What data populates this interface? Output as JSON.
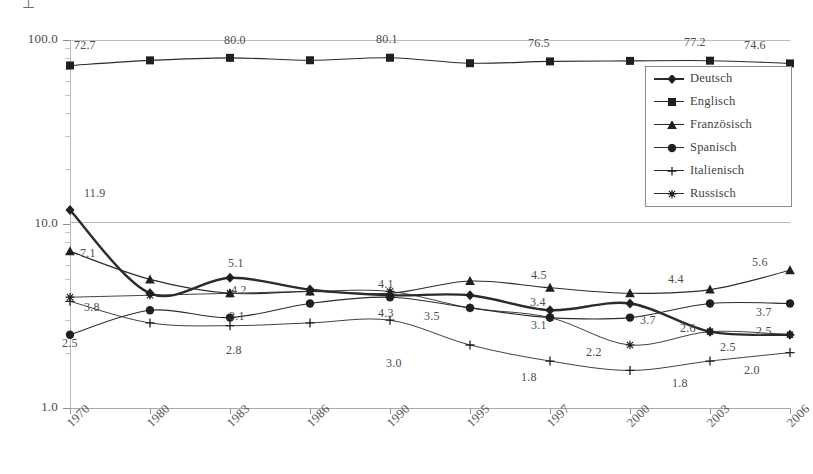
{
  "chart_data": {
    "type": "line",
    "title": "",
    "subtitle": "",
    "xlabel": "",
    "ylabel": "",
    "scale": "log",
    "grid": true,
    "legend_position": "inside-top-right",
    "categories": [
      "1970",
      "1980",
      "1983",
      "1986",
      "1990",
      "1995",
      "1997",
      "2000",
      "2003",
      "2006"
    ],
    "yticks": [
      "1.0",
      "10.0",
      "100.0"
    ],
    "ylim": [
      1.0,
      100.0
    ],
    "series": [
      {
        "name": "Deutsch",
        "marker": "diamond",
        "emphasis": "thick",
        "values": [
          11.9,
          4.2,
          5.1,
          4.4,
          4.1,
          4.1,
          3.4,
          3.7,
          2.6,
          2.5
        ],
        "labels": [
          "11.9",
          "",
          "5.1",
          "",
          "4.1",
          "",
          "3.4",
          "3.7",
          "2.6",
          "2.5"
        ]
      },
      {
        "name": "Englisch",
        "marker": "square",
        "emphasis": "normal",
        "values": [
          72.7,
          77.5,
          80.0,
          77.6,
          80.1,
          74.8,
          76.5,
          77.0,
          77.2,
          74.6
        ],
        "labels": [
          "72.7",
          "",
          "80.0",
          "",
          "80.1",
          "",
          "76.5",
          "",
          "77.2",
          "74.6"
        ]
      },
      {
        "name": "Französisch",
        "marker": "triangle",
        "emphasis": "normal",
        "values": [
          7.1,
          5.0,
          4.2,
          4.3,
          4.2,
          4.9,
          4.5,
          4.2,
          4.4,
          5.6
        ],
        "labels": [
          "7.1",
          "",
          "4.2",
          "",
          "",
          "",
          "4.5",
          "",
          "4.4",
          "5.6"
        ]
      },
      {
        "name": "Spanisch",
        "marker": "circle",
        "emphasis": "normal",
        "values": [
          2.5,
          3.4,
          3.1,
          3.7,
          4.0,
          3.5,
          3.1,
          3.1,
          3.7,
          3.7
        ],
        "labels": [
          "2.5",
          "",
          "3.1",
          "",
          "",
          "3.5",
          "3.1",
          "",
          "",
          "3.7"
        ]
      },
      {
        "name": "Italienisch",
        "marker": "plus",
        "emphasis": "thin",
        "values": [
          3.8,
          2.9,
          2.8,
          2.9,
          3.0,
          2.2,
          1.8,
          1.6,
          1.8,
          2.0
        ],
        "labels": [
          "3.8",
          "",
          "",
          "",
          "3.0",
          "",
          "1.8",
          "",
          "1.8",
          "2.0"
        ]
      },
      {
        "name": "Russisch",
        "marker": "asterisk",
        "emphasis": "thin",
        "values": [
          4.0,
          4.1,
          4.2,
          4.3,
          4.3,
          3.5,
          3.1,
          2.2,
          2.6,
          2.5
        ],
        "labels": [
          "",
          "",
          "",
          "",
          "4.3",
          "",
          "3.1",
          "2.2",
          "",
          "2.5"
        ]
      }
    ],
    "data_labels": [
      {
        "text": "72.7",
        "x": 74,
        "y": 38
      },
      {
        "text": "80.0",
        "x": 224,
        "y": 33
      },
      {
        "text": "80.1",
        "x": 376,
        "y": 32
      },
      {
        "text": "76.5",
        "x": 528,
        "y": 36
      },
      {
        "text": "77.2",
        "x": 684,
        "y": 35
      },
      {
        "text": "74.6",
        "x": 744,
        "y": 38
      },
      {
        "text": "11.9",
        "x": 84,
        "y": 186
      },
      {
        "text": "7.1",
        "x": 80,
        "y": 246
      },
      {
        "text": "3.8",
        "x": 84,
        "y": 300
      },
      {
        "text": "2.5",
        "x": 62,
        "y": 336
      },
      {
        "text": "5.1",
        "x": 228,
        "y": 256
      },
      {
        "text": "4.2",
        "x": 231,
        "y": 283
      },
      {
        "text": "3.1",
        "x": 229,
        "y": 309
      },
      {
        "text": "2.8",
        "x": 226,
        "y": 343
      },
      {
        "text": "4.3",
        "x": 378,
        "y": 306
      },
      {
        "text": "4.1",
        "x": 378,
        "y": 277
      },
      {
        "text": "3.0",
        "x": 386,
        "y": 356
      },
      {
        "text": "3.5",
        "x": 424,
        "y": 309
      },
      {
        "text": "4.5",
        "x": 531,
        "y": 268
      },
      {
        "text": "3.4",
        "x": 530,
        "y": 295
      },
      {
        "text": "3.1",
        "x": 531,
        "y": 318
      },
      {
        "text": "1.8",
        "x": 521,
        "y": 370
      },
      {
        "text": "2.2",
        "x": 586,
        "y": 345
      },
      {
        "text": "4.4",
        "x": 668,
        "y": 272
      },
      {
        "text": "3.7",
        "x": 640,
        "y": 313
      },
      {
        "text": "2.6",
        "x": 680,
        "y": 321
      },
      {
        "text": "1.8",
        "x": 672,
        "y": 376
      },
      {
        "text": "5.6",
        "x": 752,
        "y": 255
      },
      {
        "text": "3.7",
        "x": 756,
        "y": 305
      },
      {
        "text": "2.5",
        "x": 756,
        "y": 324
      },
      {
        "text": "2.5",
        "x": 720,
        "y": 340
      },
      {
        "text": "2.0",
        "x": 744,
        "y": 363
      }
    ]
  },
  "legend": {
    "items": [
      {
        "label": "Deutsch"
      },
      {
        "label": "Englisch"
      },
      {
        "label": "Französisch"
      },
      {
        "label": "Spanisch"
      },
      {
        "label": "Italienisch"
      },
      {
        "label": "Russisch"
      }
    ]
  },
  "colors": {
    "line": "#2b2b2b",
    "grid": "#bdbdbd",
    "axis": "#9a9a9a",
    "text": "#4a4a4a"
  }
}
